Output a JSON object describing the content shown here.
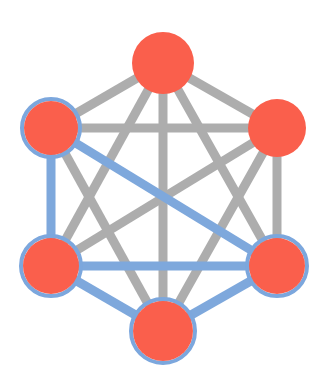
{
  "figure": {
    "width": 326,
    "height": 389,
    "background_color": "#ffffff"
  },
  "palette": {
    "node_fill": "#fa5f4c",
    "node_ring_blue": "#7ca7dd",
    "node_ring_none": "#fa5f4c",
    "edge_gray": "#adadad",
    "edge_blue": "#7ea8dc"
  },
  "chart_data": {
    "type": "diagram",
    "node_count": 6,
    "edge_count": 15,
    "nodes": [
      {
        "id": "top",
        "label": "",
        "x": 163,
        "y": 63,
        "r": 31,
        "fill": "#fa5f4c",
        "ring": "none",
        "ring_width": 0
      },
      {
        "id": "top-left",
        "label": "",
        "x": 51,
        "y": 128,
        "r": 27,
        "fill": "#fa5f4c",
        "ring": "blue",
        "ring_width": 4
      },
      {
        "id": "top-right",
        "label": "",
        "x": 277,
        "y": 128,
        "r": 29,
        "fill": "#fa5f4c",
        "ring": "none",
        "ring_width": 0
      },
      {
        "id": "bottom-left",
        "label": "",
        "x": 51,
        "y": 266,
        "r": 28,
        "fill": "#fa5f4c",
        "ring": "blue",
        "ring_width": 4
      },
      {
        "id": "bottom-right",
        "label": "",
        "x": 277,
        "y": 266,
        "r": 28,
        "fill": "#fa5f4c",
        "ring": "blue",
        "ring_width": 4
      },
      {
        "id": "bottom",
        "label": "",
        "x": 163,
        "y": 331,
        "r": 30,
        "fill": "#fa5f4c",
        "ring": "blue",
        "ring_width": 4
      }
    ],
    "edges": [
      {
        "source": "top",
        "target": "top-left",
        "color": "#adadad",
        "width": 9,
        "group": "gray"
      },
      {
        "source": "top",
        "target": "top-right",
        "color": "#adadad",
        "width": 9,
        "group": "gray"
      },
      {
        "source": "top",
        "target": "bottom-left",
        "color": "#adadad",
        "width": 9,
        "group": "gray"
      },
      {
        "source": "top",
        "target": "bottom-right",
        "color": "#adadad",
        "width": 9,
        "group": "gray"
      },
      {
        "source": "top",
        "target": "bottom",
        "color": "#adadad",
        "width": 9,
        "group": "gray"
      },
      {
        "source": "top-left",
        "target": "top-right",
        "color": "#adadad",
        "width": 9,
        "group": "gray"
      },
      {
        "source": "top-left",
        "target": "bottom",
        "color": "#adadad",
        "width": 9,
        "group": "gray"
      },
      {
        "source": "top-right",
        "target": "bottom-left",
        "color": "#adadad",
        "width": 9,
        "group": "gray"
      },
      {
        "source": "top-right",
        "target": "bottom-right",
        "color": "#adadad",
        "width": 9,
        "group": "gray"
      },
      {
        "source": "top-right",
        "target": "bottom",
        "color": "#adadad",
        "width": 9,
        "group": "gray"
      },
      {
        "source": "top-left",
        "target": "bottom-left",
        "color": "#7ea8dc",
        "width": 9,
        "group": "blue"
      },
      {
        "source": "top-left",
        "target": "bottom-right",
        "color": "#7ea8dc",
        "width": 9,
        "group": "blue"
      },
      {
        "source": "bottom-left",
        "target": "bottom-right",
        "color": "#7ea8dc",
        "width": 9,
        "group": "blue"
      },
      {
        "source": "bottom-left",
        "target": "bottom",
        "color": "#7ea8dc",
        "width": 9,
        "group": "blue"
      },
      {
        "source": "bottom",
        "target": "bottom-right",
        "color": "#7ea8dc",
        "width": 9,
        "group": "blue"
      }
    ],
    "legend": {
      "visible": false,
      "entries": []
    },
    "axes": {
      "visible": false
    },
    "grid": false
  }
}
